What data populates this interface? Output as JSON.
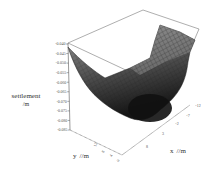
{
  "chart_data": {
    "type": "surface3d",
    "title": "",
    "zlabel": "settlement",
    "zunit": "/m",
    "xlabel": "x",
    "xunit": "/m",
    "ylabel": "y",
    "yunit": "/m",
    "z_ticks": [
      "-0.040",
      "-0.045",
      "-0.050",
      "-0.055",
      "-0.060",
      "-0.065",
      "-0.070",
      "-0.075",
      "-0.080",
      "-0.085"
    ],
    "x_ticks": [
      "8",
      "3",
      "-2",
      "-7",
      "-12"
    ],
    "y_ticks": [
      "12",
      "8",
      "4",
      "0"
    ],
    "zlim": [
      -0.085,
      -0.04
    ],
    "xlim": [
      -12,
      8
    ],
    "ylim": [
      0,
      12
    ],
    "colors": {
      "surface_light": "#9a9a9a",
      "surface_dark": "#1e1e1e",
      "mesh": "#222222",
      "axis": "#555555"
    }
  }
}
